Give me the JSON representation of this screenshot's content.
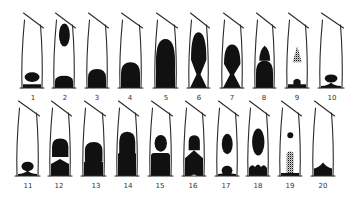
{
  "figure": {
    "type": "vial-diagram",
    "rows": 2,
    "columns": 10,
    "ink_color": "#111111",
    "background": "#ffffff"
  },
  "vials": [
    {
      "id": 1,
      "label": "1",
      "row": 0,
      "x0": 22,
      "x1": 42,
      "label_x": 33,
      "pattern": [
        {
          "kind": "blob",
          "cy": 0.84,
          "h": 0.14,
          "w": 0.75
        },
        {
          "kind": "base",
          "h": 0.04
        }
      ]
    },
    {
      "id": 2,
      "label": "2",
      "row": 0,
      "x0": 54,
      "x1": 74,
      "label_x": 65,
      "pattern": [
        {
          "kind": "oval",
          "cy": 0.22,
          "h": 0.34,
          "w": 0.6
        },
        {
          "kind": "dome",
          "top": 0.82
        }
      ]
    },
    {
      "id": 3,
      "label": "3",
      "row": 0,
      "x0": 87,
      "x1": 107,
      "label_x": 97,
      "pattern": [
        {
          "kind": "dome",
          "top": 0.72
        }
      ]
    },
    {
      "id": 4,
      "label": "4",
      "row": 0,
      "x0": 120,
      "x1": 141,
      "label_x": 130,
      "pattern": [
        {
          "kind": "dome",
          "top": 0.62
        }
      ]
    },
    {
      "id": 5,
      "label": "5",
      "row": 0,
      "x0": 155,
      "x1": 176,
      "label_x": 166,
      "pattern": [
        {
          "kind": "dome",
          "top": 0.28
        }
      ]
    },
    {
      "id": 6,
      "label": "6",
      "row": 0,
      "x0": 189,
      "x1": 208,
      "label_x": 199,
      "pattern": [
        {
          "kind": "hourglass",
          "top": 0.18,
          "waist": 0.8
        }
      ]
    },
    {
      "id": 7,
      "label": "7",
      "row": 0,
      "x0": 222,
      "x1": 242,
      "label_x": 232,
      "pattern": [
        {
          "kind": "hourglass",
          "top": 0.36,
          "waist": 0.8
        }
      ]
    },
    {
      "id": 8,
      "label": "8",
      "row": 0,
      "x0": 255,
      "x1": 274,
      "label_x": 264,
      "pattern": [
        {
          "kind": "cone",
          "top": 0.38,
          "bottom": 0.6,
          "w": 0.7
        },
        {
          "kind": "dome",
          "top": 0.6
        }
      ]
    },
    {
      "id": 9,
      "label": "9",
      "row": 0,
      "x0": 287,
      "x1": 307,
      "label_x": 297,
      "pattern": [
        {
          "kind": "stipple-cone",
          "top": 0.38,
          "bottom": 0.62,
          "w": 0.55
        },
        {
          "kind": "dome-narrow",
          "top": 0.85,
          "w": 0.4
        },
        {
          "kind": "base",
          "h": 0.04
        }
      ]
    },
    {
      "id": 10,
      "label": "10",
      "row": 0,
      "x0": 320,
      "x1": 342,
      "label_x": 332,
      "pattern": [
        {
          "kind": "oval",
          "cy": 0.86,
          "h": 0.12,
          "w": 0.55
        },
        {
          "kind": "base-spread",
          "h": 0.05
        }
      ]
    },
    {
      "id": 11,
      "label": "11",
      "row": 1,
      "x0": 17,
      "x1": 38,
      "label_x": 28,
      "pattern": [
        {
          "kind": "blob",
          "cy": 0.86,
          "h": 0.14,
          "w": 0.55
        },
        {
          "kind": "base-spread",
          "h": 0.05
        }
      ]
    },
    {
      "id": 12,
      "label": "12",
      "row": 1,
      "x0": 50,
      "x1": 70,
      "label_x": 59,
      "pattern": [
        {
          "kind": "bell",
          "top": 0.45,
          "bottom": 0.72
        },
        {
          "kind": "peak",
          "top": 0.75
        }
      ]
    },
    {
      "id": 13,
      "label": "13",
      "row": 1,
      "x0": 83,
      "x1": 104,
      "label_x": 96,
      "pattern": [
        {
          "kind": "bell",
          "top": 0.5,
          "bottom": 0.78
        },
        {
          "kind": "peak",
          "top": 0.72
        }
      ]
    },
    {
      "id": 14,
      "label": "14",
      "row": 1,
      "x0": 117,
      "x1": 137,
      "label_x": 128,
      "pattern": [
        {
          "kind": "bell",
          "top": 0.35,
          "bottom": 0.68
        },
        {
          "kind": "peak",
          "top": 0.6
        }
      ]
    },
    {
      "id": 15,
      "label": "15",
      "row": 1,
      "x0": 150,
      "x1": 171,
      "label_x": 160,
      "pattern": [
        {
          "kind": "head",
          "cy": 0.52,
          "r": 0.22
        },
        {
          "kind": "block",
          "top": 0.66
        }
      ]
    },
    {
      "id": 16,
      "label": "16",
      "row": 1,
      "x0": 184,
      "x1": 204,
      "label_x": 193,
      "pattern": [
        {
          "kind": "bell",
          "top": 0.4,
          "bottom": 0.62,
          "w": 0.7
        },
        {
          "kind": "peak-notch",
          "top": 0.62
        }
      ]
    },
    {
      "id": 17,
      "label": "17",
      "row": 1,
      "x0": 217,
      "x1": 237,
      "label_x": 226,
      "pattern": [
        {
          "kind": "oval",
          "cy": 0.53,
          "h": 0.3,
          "w": 0.55
        },
        {
          "kind": "blob",
          "cy": 0.92,
          "h": 0.14,
          "w": 0.5
        },
        {
          "kind": "base-spread",
          "h": 0.04
        }
      ]
    },
    {
      "id": 18,
      "label": "18",
      "row": 1,
      "x0": 248,
      "x1": 268,
      "label_x": 258,
      "pattern": [
        {
          "kind": "oval",
          "cy": 0.5,
          "h": 0.4,
          "w": 0.65
        },
        {
          "kind": "bumps",
          "top": 0.84
        }
      ]
    },
    {
      "id": 19,
      "label": "19",
      "row": 1,
      "x0": 280,
      "x1": 300,
      "label_x": 290,
      "pattern": [
        {
          "kind": "dot",
          "cy": 0.4,
          "r": 0.07
        },
        {
          "kind": "stipple-bar",
          "top": 0.62,
          "w": 0.4
        },
        {
          "kind": "base",
          "h": 0.03
        }
      ]
    },
    {
      "id": 20,
      "label": "20",
      "row": 1,
      "x0": 313,
      "x1": 333,
      "label_x": 323,
      "pattern": [
        {
          "kind": "mound",
          "top": 0.8
        }
      ]
    }
  ],
  "layout": {
    "row_geometry": [
      {
        "top_y": 20,
        "bottom_y": 88,
        "label_y": 100,
        "cap_rise": 7
      },
      {
        "top_y": 108,
        "bottom_y": 176,
        "label_y": 188,
        "cap_rise": 7
      }
    ]
  }
}
